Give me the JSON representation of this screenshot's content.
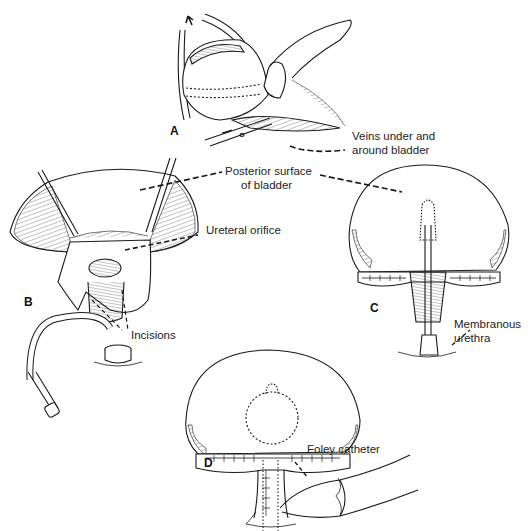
{
  "figure": {
    "panels": [
      {
        "id": "A",
        "letter": "A"
      },
      {
        "id": "B",
        "letter": "B"
      },
      {
        "id": "C",
        "letter": "C"
      },
      {
        "id": "D",
        "letter": "D"
      }
    ],
    "labels": {
      "veins": [
        "Veins under and",
        "around bladder"
      ],
      "posterior": [
        "Posterior surface",
        "of bladder"
      ],
      "ureteral": "Ureteral orifice",
      "incisions": "Incisions",
      "membranous": [
        "Membranous",
        "urethra"
      ],
      "foley": "Foley catheter"
    },
    "colors": {
      "ink": "#1a1a1a",
      "background": "#ffffff"
    }
  }
}
